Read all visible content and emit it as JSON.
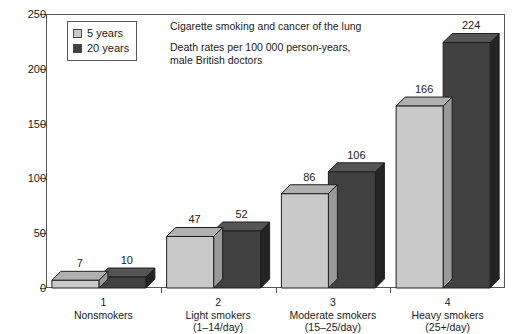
{
  "chart_data": {
    "type": "bar",
    "title": "Cigarette smoking and cancer of the lung",
    "subtitle": "Death rates per 100 000 person-years,\nmale British doctors",
    "xlabel": "",
    "ylabel": "",
    "ylim": [
      0,
      250
    ],
    "yticks": [
      0,
      50,
      100,
      150,
      200,
      250
    ],
    "grid": false,
    "legend_position": "inside-top-left",
    "categories": [
      "Nonsmokers",
      "Light smokers",
      "Moderate smokers",
      "Heavy smokers"
    ],
    "category_numbers": [
      "1",
      "2",
      "3",
      "4"
    ],
    "category_sublabels": [
      "",
      "(1–14/day)",
      "(15–25/day)",
      "(25+/day)"
    ],
    "series": [
      {
        "name": "5 years",
        "color": "#c9c9c9",
        "values": [
          7,
          47,
          86,
          166
        ]
      },
      {
        "name": "20 years",
        "color": "#414141",
        "values": [
          10,
          52,
          106,
          224
        ]
      }
    ]
  },
  "legend": {
    "items": [
      {
        "label": "5 years",
        "swatch_color": "#c9c9c9"
      },
      {
        "label": "20 years",
        "swatch_color": "#3f3f3f"
      }
    ]
  },
  "axes": {
    "y_tick_labels": [
      "250",
      "200",
      "150",
      "100",
      "50",
      "0"
    ]
  },
  "colors": {
    "bar_light_front": "#c9c9c9",
    "bar_light_top": "#b0b0b0",
    "bar_light_side": "#9a9a9a",
    "bar_dark_front": "#414141",
    "bar_dark_top": "#555555",
    "bar_dark_side": "#242424",
    "axis": "#575757",
    "text": "#1c1c1c",
    "background": "#ffffff"
  }
}
